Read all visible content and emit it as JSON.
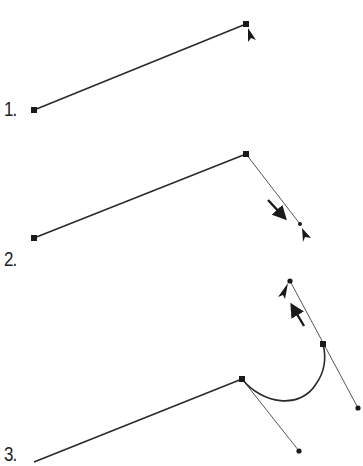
{
  "caption_top": "(cut-off caption text)",
  "steps": [
    {
      "label": "1."
    },
    {
      "label": "2."
    },
    {
      "label": "3."
    }
  ],
  "colors": {
    "path": "#2a2a2a",
    "handle_line": "#555555",
    "anchor": "#1a1a1a",
    "background": "#ffffff"
  },
  "panels": [
    {
      "id": 1,
      "segment": {
        "from": [
          34,
          110
        ],
        "to": [
          246,
          24
        ]
      },
      "anchors": [
        [
          34,
          110
        ],
        [
          246,
          24
        ]
      ],
      "cursor": "pen-selection-arrow",
      "cursor_pos": [
        248,
        28
      ]
    },
    {
      "id": 2,
      "segment": {
        "from": [
          34,
          238
        ],
        "to": [
          246,
          154
        ]
      },
      "anchors": [
        [
          34,
          238
        ],
        [
          246,
          154
        ]
      ],
      "handle": {
        "from": [
          246,
          154
        ],
        "to": [
          300,
          224
        ]
      },
      "drag_arrow": {
        "from": [
          268,
          200
        ],
        "to": [
          285,
          219
        ],
        "direction": "down-right"
      },
      "cursor": "pen-selection-arrow",
      "cursor_pos": [
        302,
        229
      ]
    },
    {
      "id": 3,
      "segment": {
        "from": [
          34,
          462
        ],
        "to": [
          242,
          379
        ]
      },
      "anchors": [
        [
          242,
          379
        ],
        [
          323,
          344
        ]
      ],
      "handles": [
        {
          "from": [
            242,
            379
          ],
          "to": [
            299,
            451
          ]
        },
        {
          "from": [
            290,
            281
          ],
          "to": [
            358,
            408
          ]
        }
      ],
      "curve": {
        "from": [
          242,
          379
        ],
        "to": [
          323,
          344
        ]
      },
      "drag_arrow": {
        "from": [
          304,
          326
        ],
        "to": [
          292,
          305
        ],
        "direction": "up-left"
      },
      "cursor": "pen-selection-arrow",
      "cursor_pos": [
        287,
        284
      ]
    }
  ]
}
